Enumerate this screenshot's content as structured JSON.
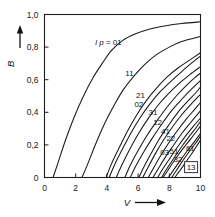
{
  "chart_data": {
    "type": "line",
    "title": "",
    "xlabel": "V",
    "ylabel": "B",
    "xlim": [
      0,
      10
    ],
    "ylim": [
      0,
      1.0
    ],
    "grid": false,
    "legend": "inline-curve-labels",
    "x_ticks": [
      "0",
      "2",
      "4",
      "6",
      "8",
      "10"
    ],
    "x_tick_values": [
      0,
      2,
      4,
      6,
      8,
      10
    ],
    "y_ticks": [
      "0",
      "0,2",
      "0,4",
      "0,6",
      "0,8",
      "1,0"
    ],
    "y_tick_values": [
      0,
      0.2,
      0.4,
      0.6,
      0.8,
      1.0
    ],
    "decimal_separator": ",",
    "first_label_prefix": "l p =",
    "series": [
      {
        "name": "01",
        "label": "l p = 01",
        "label_x": 4.1,
        "label_y": 0.81,
        "points": [
          [
            0.55,
            0.0
          ],
          [
            0.9,
            0.1
          ],
          [
            1.35,
            0.23
          ],
          [
            1.9,
            0.37
          ],
          [
            2.5,
            0.5
          ],
          [
            3.1,
            0.61
          ],
          [
            3.7,
            0.7
          ],
          [
            4.3,
            0.78
          ],
          [
            5.0,
            0.84
          ],
          [
            5.8,
            0.88
          ],
          [
            6.7,
            0.91
          ],
          [
            7.7,
            0.93
          ],
          [
            8.8,
            0.945
          ],
          [
            10.0,
            0.955
          ]
        ]
      },
      {
        "name": "11",
        "label": "11",
        "label_x": 5.45,
        "label_y": 0.625,
        "points": [
          [
            2.4,
            0.0
          ],
          [
            2.8,
            0.09
          ],
          [
            3.3,
            0.21
          ],
          [
            3.9,
            0.34
          ],
          [
            4.5,
            0.45
          ],
          [
            5.1,
            0.545
          ],
          [
            5.8,
            0.63
          ],
          [
            6.5,
            0.7
          ],
          [
            7.2,
            0.755
          ],
          [
            8.0,
            0.8
          ],
          [
            8.8,
            0.835
          ],
          [
            10.0,
            0.865
          ]
        ]
      },
      {
        "name": "21",
        "label": "21",
        "label_x": 6.15,
        "label_y": 0.49,
        "points": [
          [
            3.95,
            0.0
          ],
          [
            4.3,
            0.085
          ],
          [
            4.8,
            0.185
          ],
          [
            5.35,
            0.29
          ],
          [
            5.95,
            0.39
          ],
          [
            6.55,
            0.475
          ],
          [
            7.2,
            0.55
          ],
          [
            7.9,
            0.62
          ],
          [
            8.6,
            0.675
          ],
          [
            9.3,
            0.72
          ],
          [
            10.0,
            0.765
          ]
        ]
      },
      {
        "name": "02",
        "label": "02",
        "label_x": 6.05,
        "label_y": 0.435,
        "points": [
          [
            4.15,
            0.0
          ],
          [
            4.5,
            0.08
          ],
          [
            5.0,
            0.175
          ],
          [
            5.55,
            0.275
          ],
          [
            6.15,
            0.37
          ],
          [
            6.75,
            0.45
          ],
          [
            7.4,
            0.525
          ],
          [
            8.1,
            0.59
          ],
          [
            8.8,
            0.65
          ],
          [
            9.4,
            0.7
          ],
          [
            10.0,
            0.745
          ]
        ]
      },
      {
        "name": "31",
        "label": "31",
        "label_x": 6.95,
        "label_y": 0.385,
        "points": [
          [
            5.15,
            0.0
          ],
          [
            5.5,
            0.075
          ],
          [
            6.0,
            0.165
          ],
          [
            6.55,
            0.255
          ],
          [
            7.15,
            0.34
          ],
          [
            7.8,
            0.425
          ],
          [
            8.45,
            0.5
          ],
          [
            9.1,
            0.565
          ],
          [
            9.6,
            0.61
          ],
          [
            10.0,
            0.64
          ]
        ]
      },
      {
        "name": "12",
        "label": "12",
        "label_x": 7.25,
        "label_y": 0.325,
        "points": [
          [
            5.5,
            0.0
          ],
          [
            5.85,
            0.07
          ],
          [
            6.35,
            0.155
          ],
          [
            6.9,
            0.24
          ],
          [
            7.5,
            0.325
          ],
          [
            8.15,
            0.41
          ],
          [
            8.8,
            0.48
          ],
          [
            9.4,
            0.54
          ],
          [
            10.0,
            0.595
          ]
        ]
      },
      {
        "name": "41",
        "label": "41",
        "label_x": 7.75,
        "label_y": 0.265,
        "points": [
          [
            6.3,
            0.0
          ],
          [
            6.65,
            0.065
          ],
          [
            7.1,
            0.145
          ],
          [
            7.6,
            0.225
          ],
          [
            8.2,
            0.31
          ],
          [
            8.8,
            0.385
          ],
          [
            9.4,
            0.45
          ],
          [
            10.0,
            0.51
          ]
        ]
      },
      {
        "name": "22",
        "label": "22",
        "label_x": 8.1,
        "label_y": 0.225,
        "points": [
          [
            6.65,
            0.0
          ],
          [
            7.0,
            0.06
          ],
          [
            7.45,
            0.135
          ],
          [
            7.95,
            0.21
          ],
          [
            8.5,
            0.285
          ],
          [
            9.1,
            0.36
          ],
          [
            9.6,
            0.415
          ],
          [
            10.0,
            0.46
          ]
        ]
      },
      {
        "name": "03",
        "label": "03",
        "label_x": 7.7,
        "label_y": 0.135,
        "points": [
          [
            6.95,
            0.0
          ],
          [
            7.3,
            0.055
          ],
          [
            7.75,
            0.125
          ],
          [
            8.25,
            0.195
          ],
          [
            8.8,
            0.27
          ],
          [
            9.3,
            0.33
          ],
          [
            9.7,
            0.375
          ],
          [
            10.0,
            0.41
          ]
        ]
      },
      {
        "name": "51",
        "label": "51",
        "label_x": 8.3,
        "label_y": 0.145,
        "points": [
          [
            7.25,
            0.0
          ],
          [
            7.6,
            0.055
          ],
          [
            8.05,
            0.12
          ],
          [
            8.55,
            0.19
          ],
          [
            9.05,
            0.255
          ],
          [
            9.55,
            0.315
          ],
          [
            10.0,
            0.365
          ]
        ]
      },
      {
        "name": "32",
        "label": "32",
        "label_x": 8.55,
        "label_y": 0.095,
        "points": [
          [
            7.6,
            0.0
          ],
          [
            7.95,
            0.05
          ],
          [
            8.4,
            0.115
          ],
          [
            8.9,
            0.18
          ],
          [
            9.4,
            0.24
          ],
          [
            9.8,
            0.29
          ],
          [
            10.0,
            0.315
          ]
        ]
      },
      {
        "name": "61",
        "label": "61",
        "label_x": 9.35,
        "label_y": 0.16,
        "points": [
          [
            7.95,
            0.0
          ],
          [
            8.3,
            0.05
          ],
          [
            8.75,
            0.11
          ],
          [
            9.2,
            0.17
          ],
          [
            9.65,
            0.225
          ],
          [
            10.0,
            0.27
          ]
        ]
      },
      {
        "name": "13",
        "label": "13",
        "label_x": 9.4,
        "label_y": 0.045,
        "points": [
          [
            8.35,
            0.0
          ],
          [
            8.7,
            0.045
          ],
          [
            9.1,
            0.1
          ],
          [
            9.5,
            0.155
          ],
          [
            9.8,
            0.2
          ],
          [
            10.0,
            0.23
          ]
        ]
      },
      {
        "name": "unlabeled-a",
        "label": "",
        "label_x": null,
        "label_y": null,
        "points": [
          [
            4.6,
            0.0
          ],
          [
            4.95,
            0.075
          ],
          [
            5.45,
            0.17
          ],
          [
            6.0,
            0.265
          ],
          [
            6.6,
            0.355
          ],
          [
            7.25,
            0.44
          ],
          [
            7.9,
            0.51
          ],
          [
            8.6,
            0.575
          ],
          [
            9.3,
            0.63
          ],
          [
            10.0,
            0.68
          ]
        ]
      },
      {
        "name": "unlabeled-b",
        "label": "",
        "label_x": null,
        "label_y": null,
        "points": [
          [
            6.05,
            0.0
          ],
          [
            6.4,
            0.07
          ],
          [
            6.85,
            0.15
          ],
          [
            7.35,
            0.235
          ],
          [
            7.95,
            0.32
          ],
          [
            8.55,
            0.4
          ],
          [
            9.2,
            0.47
          ],
          [
            9.7,
            0.52
          ],
          [
            10.0,
            0.555
          ]
        ]
      },
      {
        "name": "unlabeled-c",
        "label": "",
        "label_x": null,
        "label_y": null,
        "points": [
          [
            7.5,
            0.0
          ],
          [
            7.85,
            0.055
          ],
          [
            8.3,
            0.12
          ],
          [
            8.8,
            0.19
          ],
          [
            9.3,
            0.255
          ],
          [
            9.75,
            0.31
          ],
          [
            10.0,
            0.345
          ]
        ]
      },
      {
        "name": "unlabeled-d",
        "label": "",
        "label_x": null,
        "label_y": null,
        "points": [
          [
            8.15,
            0.0
          ],
          [
            8.5,
            0.05
          ],
          [
            8.95,
            0.115
          ],
          [
            9.4,
            0.175
          ],
          [
            9.8,
            0.225
          ],
          [
            10.0,
            0.255
          ]
        ]
      }
    ]
  },
  "axes": {
    "y_axis_title": "B",
    "x_axis_title": "V",
    "y_arrow": "up-arrow",
    "x_arrow": "right-arrow"
  }
}
